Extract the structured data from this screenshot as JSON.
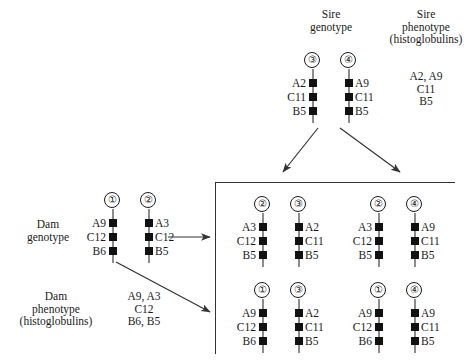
{
  "headers": {
    "sire_genotype": "Sire\ngenotype",
    "sire_phenotype": "Sire\nphenotype\n(histoglobulins)",
    "dam_genotype": "Dam\ngenotype",
    "dam_phenotype": "Dam\nphenotype\n(histoglobulins)"
  },
  "sire": {
    "chromosomes": [
      {
        "number": "③",
        "labels": [
          "A2",
          "C11",
          "B5"
        ],
        "side": "left"
      },
      {
        "number": "④",
        "labels": [
          "A9",
          "C11",
          "B5"
        ],
        "side": "right"
      }
    ],
    "phenotype": "A2, A9\nC11\nB5"
  },
  "dam": {
    "chromosomes": [
      {
        "number": "①",
        "labels": [
          "A9",
          "C12",
          "B6"
        ],
        "side": "left"
      },
      {
        "number": "②",
        "labels": [
          "A3",
          "C12",
          "B5"
        ],
        "side": "right"
      }
    ],
    "phenotype": "A9, A3\nC12\nB6, B5"
  },
  "offspring": [
    {
      "id": "offspring-2-3",
      "chromosomes": [
        {
          "number": "②",
          "labels": [
            "A3",
            "C12",
            "B5"
          ],
          "side": "left"
        },
        {
          "number": "③",
          "labels": [
            "A2",
            "C11",
            "B5"
          ],
          "side": "right"
        }
      ]
    },
    {
      "id": "offspring-2-4",
      "chromosomes": [
        {
          "number": "②",
          "labels": [
            "A3",
            "C12",
            "B5"
          ],
          "side": "left"
        },
        {
          "number": "④",
          "labels": [
            "A9",
            "C11",
            "B5"
          ],
          "side": "right"
        }
      ]
    },
    {
      "id": "offspring-1-3",
      "chromosomes": [
        {
          "number": "①",
          "labels": [
            "A9",
            "C12",
            "B6"
          ],
          "side": "left"
        },
        {
          "number": "③",
          "labels": [
            "A2",
            "C11",
            "B5"
          ],
          "side": "right"
        }
      ]
    },
    {
      "id": "offspring-1-4",
      "chromosomes": [
        {
          "number": "①",
          "labels": [
            "A9",
            "C12",
            "B6"
          ],
          "side": "left"
        },
        {
          "number": "④",
          "labels": [
            "A9",
            "C11",
            "B5"
          ],
          "side": "right"
        }
      ]
    }
  ],
  "colors": {
    "marker": "#111111",
    "chromosome_line": "#8c8c8c",
    "rule": "#333333",
    "text": "#1a1a1a"
  }
}
